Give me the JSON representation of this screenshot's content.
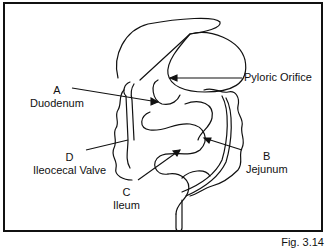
{
  "figure": {
    "number_label": "Fig. 3.14",
    "labels": [
      {
        "letter": "A",
        "name": "Duodenum"
      },
      {
        "letter": "B",
        "name": "Jejunum"
      },
      {
        "letter": "C",
        "name": "Ileum"
      },
      {
        "letter": "D",
        "name": "Ileocecal Valve"
      }
    ],
    "pyloric": "Pyloric Orifice"
  }
}
